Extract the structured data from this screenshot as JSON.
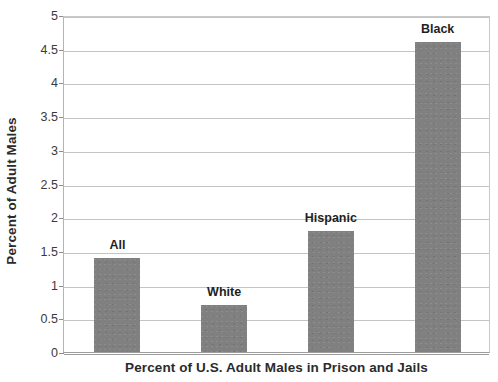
{
  "chart_data": {
    "type": "bar",
    "title": "",
    "xlabel": "Percent of U.S. Adult Males in Prison and Jails",
    "ylabel": "Percent of Adult Males",
    "categories": [
      "All",
      "White",
      "Hispanic",
      "Black"
    ],
    "values": [
      1.4,
      0.7,
      1.8,
      4.6
    ],
    "series": [
      {
        "name": "Percent of Adult Males",
        "values": [
          1.4,
          0.7,
          1.8,
          4.6
        ]
      }
    ],
    "point_labels": [
      "All",
      "White",
      "Hispanic",
      "Black"
    ],
    "ylim": [
      0,
      5
    ],
    "y_ticks": [
      0,
      0.5,
      1,
      1.5,
      2,
      2.5,
      3,
      3.5,
      4,
      4.5,
      5
    ],
    "y_tick_labels": [
      "0",
      "0.5",
      "1",
      "1.5",
      "2",
      "2.5",
      "3",
      "3.5",
      "4",
      "4.5",
      "5"
    ],
    "x_tick_labels": [],
    "grid": true,
    "grid_axis": "y",
    "legend": false,
    "legend_position": "none",
    "bar_color": "#808080",
    "grid_color": "#c4c4c4",
    "axis_color": "#9e9e9e",
    "text_color": "#2b2b2b"
  }
}
